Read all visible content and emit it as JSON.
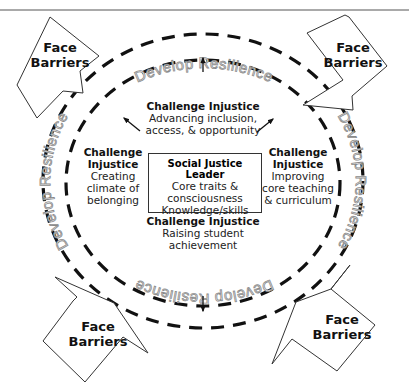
{
  "diagram": {
    "ring_label": "Develop Resilience",
    "colors": {
      "ring": "#111111",
      "ring_text_stroke": "#8a8a8a",
      "line": "#333333",
      "background": "#ffffff"
    },
    "center": {
      "title": "Social Justice Leader",
      "lines": [
        "Core traits &",
        "consciousness",
        "Knowledge/skills"
      ]
    },
    "challenges": {
      "top": {
        "title": "Challenge Injustice",
        "lines": [
          "Advancing inclusion,",
          "access, & opportunity"
        ]
      },
      "left": {
        "title_lines": [
          "Challenge",
          "Injustice"
        ],
        "lines": [
          "Creating",
          "climate of",
          "belonging"
        ]
      },
      "right": {
        "title_lines": [
          "Challenge",
          "Injustice"
        ],
        "lines": [
          "Improving",
          "core teaching",
          "& curriculum"
        ]
      },
      "bottom": {
        "title": "Challenge Injustice",
        "lines": [
          "Raising student",
          "achievement"
        ]
      }
    },
    "barriers": {
      "top_left": [
        "Face",
        "Barriers"
      ],
      "top_right": [
        "Face",
        "Barriers"
      ],
      "bottom_left": [
        "Face",
        "Barriers"
      ],
      "bottom_right": [
        "Face",
        "Barriers"
      ]
    }
  }
}
